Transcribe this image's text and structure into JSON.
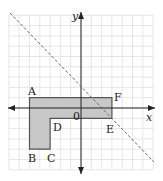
{
  "diagram": {
    "type": "coordinate-grid",
    "grid": {
      "x_min": -7,
      "x_max": 7,
      "y_min": -6,
      "y_max": 9,
      "cell_px": 10.3,
      "origin_px": [
        81,
        108
      ],
      "line_color": "#dddddd"
    },
    "axes": {
      "x_label": "x",
      "y_label": "y",
      "origin_label": "0",
      "color": "#222222"
    },
    "shape": {
      "fill": "#c8c8c8",
      "stroke": "#555555",
      "vertices": [
        {
          "name": "A",
          "x": -5,
          "y": 1
        },
        {
          "name": "F",
          "x": 3,
          "y": 1
        },
        {
          "name": "E",
          "x": 3,
          "y": -1
        },
        {
          "name": "D",
          "x": -3,
          "y": -1
        },
        {
          "name": "C",
          "x": -3,
          "y": -4
        },
        {
          "name": "B",
          "x": -5,
          "y": -4
        }
      ]
    },
    "line": {
      "style": "dashed",
      "equation": "y = -x + 2",
      "color": "#666666"
    },
    "labels": {
      "A": "A",
      "B": "B",
      "C": "C",
      "D": "D",
      "E": "E",
      "F": "F"
    }
  }
}
